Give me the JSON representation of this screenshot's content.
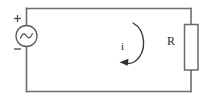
{
  "figure": {
    "background_color": "#ffffff",
    "wire_color": "#6e6e6e"
  },
  "components": {
    "source": {
      "name": "ac-voltage-source",
      "symbol": "sine-wave-in-circle",
      "plus_label": "+",
      "minus_label": "−",
      "position": "left-branch"
    },
    "resistor": {
      "name": "resistor",
      "label": "R",
      "symbol": "rectangle-box",
      "position": "right-branch"
    },
    "current": {
      "name": "loop-current",
      "label": "i",
      "direction": "counterclockwise",
      "symbol": "curved-arrow"
    }
  },
  "loop": {
    "shape": "rectangle",
    "nodes": [
      "top-left",
      "top-right",
      "bottom-right",
      "bottom-left"
    ]
  }
}
